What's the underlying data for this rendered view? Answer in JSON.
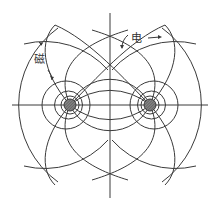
{
  "diagram": {
    "title": "",
    "labels": {
      "magnetic": "磁",
      "electric": "电"
    },
    "colors": {
      "line": "#3a3a3a",
      "conductor_fill": "#777777",
      "background": "#ffffff"
    },
    "conductors": [
      {
        "name": "left-conductor",
        "cx": 70,
        "cy": 105,
        "r": 6
      },
      {
        "name": "right-conductor",
        "cx": 150,
        "cy": 105,
        "r": 6
      }
    ],
    "axes": {
      "horizontal": {
        "x1": 12,
        "x2": 208,
        "y": 105
      },
      "vertical": {
        "x": 110,
        "y1": 13,
        "y2": 198
      }
    }
  }
}
